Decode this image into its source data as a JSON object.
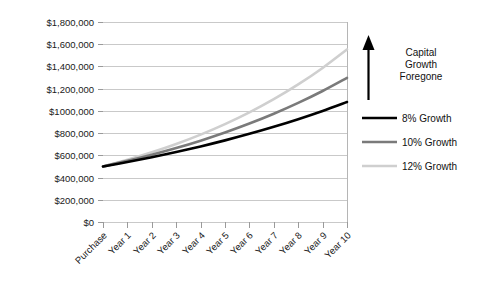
{
  "chart_data": {
    "type": "line",
    "title": "",
    "xlabel": "",
    "ylabel": "",
    "categories": [
      "Purchase",
      "Year 1",
      "Year 2",
      "Year 3",
      "Year 4",
      "Year 5",
      "Year 6",
      "Year 7",
      "Year 8",
      "Year 9",
      "Year 10"
    ],
    "ylim": [
      0,
      1800000
    ],
    "ytick_values": [
      0,
      200000,
      400000,
      600000,
      800000,
      1000000,
      1200000,
      1400000,
      1600000,
      1800000
    ],
    "ytick_labels": [
      "$0",
      "$200,000",
      "$400,000",
      "$600,000",
      "$800,000",
      "$1000,000",
      "$1,200,000",
      "$1,400,000",
      "$1,600,000",
      "$1,800,000"
    ],
    "grid": true,
    "legend_position": "right",
    "series": [
      {
        "name": "8% Growth",
        "color": "#000000",
        "width": 2.6,
        "values": [
          500000,
          540000,
          583200,
          629856,
          680244,
          734664,
          793437,
          856911,
          925465,
          999502,
          1079462
        ]
      },
      {
        "name": "10% Growth",
        "color": "#7a7a7a",
        "width": 2.6,
        "values": [
          500000,
          550000,
          605000,
          665500,
          732050,
          805255,
          885781,
          974359,
          1071794,
          1178974,
          1296871
        ]
      },
      {
        "name": "12% Growth",
        "color": "#cfcfcf",
        "width": 2.6,
        "values": [
          500000,
          560000,
          627200,
          702464,
          786758,
          881169,
          986909,
          1105338,
          1237978,
          1386535,
          1552919
        ]
      }
    ],
    "annotation": {
      "lines": [
        "Capital",
        "Growth",
        "Foregone"
      ],
      "arrow": "up-arrow"
    }
  }
}
